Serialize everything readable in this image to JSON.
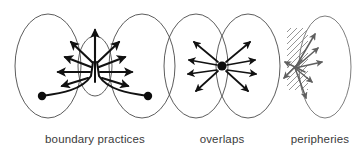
{
  "figure": {
    "background_color": "#ffffff",
    "line_color": "#4a4a4a",
    "arrow_color": "#111111",
    "grey_arrow_color": "#5f5f5f",
    "caption_color": "#3a3a3a",
    "panels": [
      {
        "id": "boundary-practices",
        "caption": "boundary practices",
        "caption_x": 95,
        "caption_y": 143,
        "description": "Two large vertical ellipses side by side with a small central ellipse between them; two filled dots near the bottom connect by curving lines to a central stem from which arrows radiate outward.",
        "shapes": {
          "ellipse_left": {
            "cx": 48,
            "cy": 66,
            "rx": 33,
            "ry": 52
          },
          "ellipse_right": {
            "cx": 142,
            "cy": 66,
            "rx": 33,
            "ry": 52
          },
          "ellipse_center": {
            "cx": 95,
            "cy": 66,
            "rx": 17,
            "ry": 30
          },
          "dot_left": {
            "cx": 42,
            "cy": 96,
            "r": 4.2
          },
          "dot_right": {
            "cx": 148,
            "cy": 96,
            "r": 4.2
          }
        },
        "arrow_count": 9
      },
      {
        "id": "overlaps",
        "caption": "overlaps",
        "caption_x": 222,
        "caption_y": 143,
        "description": "Two overlapping vertical ellipses forming a vennlike intersection with a single filled dot at the crossing point and eight arrows radiating outward.",
        "shapes": {
          "ellipse_left": {
            "cx": 196,
            "cy": 66,
            "rx": 32,
            "ry": 52
          },
          "ellipse_right": {
            "cx": 248,
            "cy": 66,
            "rx": 32,
            "ry": 52
          },
          "dot_center": {
            "cx": 222,
            "cy": 66,
            "r": 4.6
          }
        },
        "arrow_count": 8
      },
      {
        "id": "peripheries",
        "caption": "peripheries",
        "caption_x": 320,
        "caption_y": 143,
        "description": "A single vertical ellipse with a diagonally hatched band along its left edge; arrows fan out from a point inside the hatched band.",
        "shapes": {
          "ellipse": {
            "cx": 325,
            "cy": 67,
            "rx": 26,
            "ry": 51
          },
          "hatch_band": {
            "x": 287,
            "y": 28,
            "width": 21,
            "height": 62
          },
          "origin": {
            "cx": 295,
            "cy": 68
          }
        },
        "arrow_count": 7
      }
    ]
  }
}
